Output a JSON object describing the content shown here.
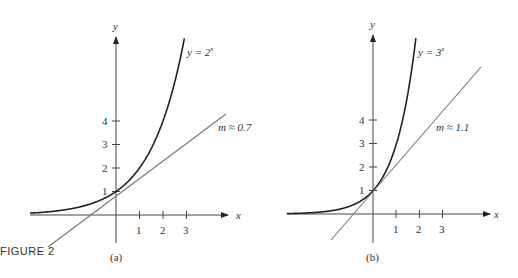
{
  "figure": {
    "caption": "FIGURE 2"
  },
  "panels": [
    {
      "label": "(a)",
      "curve_label": "y = 2",
      "curve_exp": "x",
      "slope_label": "m ≈ 0.7",
      "axis_x": "x",
      "axis_y": "y",
      "xticks": [
        "1",
        "2",
        "3"
      ],
      "yticks": [
        "1",
        "2",
        "3",
        "4"
      ]
    },
    {
      "label": "(b)",
      "curve_label": "y = 3",
      "curve_exp": "x",
      "slope_label": "m ≈ 1.1",
      "axis_x": "x",
      "axis_y": "y",
      "xticks": [
        "1",
        "2",
        "3"
      ],
      "yticks": [
        "1",
        "2",
        "3",
        "4"
      ]
    }
  ],
  "chart_data": [
    {
      "type": "line",
      "title": "(a)",
      "series": [
        {
          "name": "y = 2^x",
          "function": "2^x"
        },
        {
          "name": "tangent m ≈ 0.7",
          "function": "1 + 0.7x"
        }
      ],
      "xlabel": "x",
      "ylabel": "y",
      "xticks": [
        1,
        2,
        3
      ],
      "yticks": [
        1,
        2,
        3,
        4
      ]
    },
    {
      "type": "line",
      "title": "(b)",
      "series": [
        {
          "name": "y = 3^x",
          "function": "3^x"
        },
        {
          "name": "tangent m ≈ 1.1",
          "function": "1 + 1.1x"
        }
      ],
      "xlabel": "x",
      "ylabel": "y",
      "xticks": [
        1,
        2,
        3
      ],
      "yticks": [
        1,
        2,
        3,
        4
      ]
    }
  ]
}
